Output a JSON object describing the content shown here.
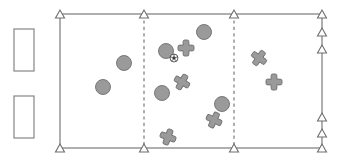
{
  "diagram": {
    "canvas": {
      "width": 344,
      "height": 162
    },
    "colors": {
      "line": "#6e6e6e",
      "marker_fill": "#9a9a9a",
      "marker_stroke": "#6e6e6e",
      "ball_fill": "#f2f2f2",
      "ball_stroke": "#3a3a3a",
      "rect_fill": "#ffffff",
      "rect_stroke": "#7a7a7a",
      "background": "#ffffff"
    },
    "field": {
      "name": "field-boundary",
      "left": 60,
      "right": 322,
      "top": 14,
      "bottom": 148
    },
    "divider_lines": [
      {
        "name": "dashed-divider-1",
        "x": 144,
        "style": "dashed"
      },
      {
        "name": "dashed-divider-2",
        "x": 234,
        "style": "dashed"
      }
    ],
    "side_rectangles": [
      {
        "name": "bench-box-top",
        "x": 14,
        "y": 29,
        "width": 20,
        "height": 42
      },
      {
        "name": "bench-box-bottom",
        "x": 14,
        "y": 96,
        "width": 20,
        "height": 42
      }
    ],
    "triangle_markers": {
      "top_edge": [
        {
          "x": 60,
          "y": 14
        },
        {
          "x": 144,
          "y": 14
        },
        {
          "x": 234,
          "y": 14
        },
        {
          "x": 322,
          "y": 14
        }
      ],
      "bottom_edge": [
        {
          "x": 60,
          "y": 148
        },
        {
          "x": 144,
          "y": 148
        },
        {
          "x": 234,
          "y": 148
        },
        {
          "x": 322,
          "y": 148
        }
      ],
      "right_edge": [
        {
          "x": 322,
          "y": 32
        },
        {
          "x": 322,
          "y": 49
        },
        {
          "x": 322,
          "y": 117
        },
        {
          "x": 322,
          "y": 133
        }
      ]
    },
    "circle_players": [
      {
        "name": "circle-player-1",
        "cx": 103,
        "cy": 87,
        "r": 7.5
      },
      {
        "name": "circle-player-2",
        "cx": 124,
        "cy": 63,
        "r": 7.5
      },
      {
        "name": "circle-player-3",
        "cx": 166,
        "cy": 51,
        "r": 7.5
      },
      {
        "name": "circle-player-4",
        "cx": 204,
        "cy": 32,
        "r": 7.5
      },
      {
        "name": "circle-player-5",
        "cx": 162,
        "cy": 93,
        "r": 7.5
      },
      {
        "name": "circle-player-6",
        "cx": 222,
        "cy": 104,
        "r": 7.5
      }
    ],
    "cross_players": [
      {
        "name": "cross-player-1",
        "cx": 186,
        "cy": 48,
        "size": 8,
        "rotation": 0
      },
      {
        "name": "cross-player-2",
        "cx": 182,
        "cy": 82,
        "size": 8,
        "rotation": 30
      },
      {
        "name": "cross-player-3",
        "cx": 214,
        "cy": 120,
        "size": 8,
        "rotation": 25
      },
      {
        "name": "cross-player-4",
        "cx": 168,
        "cy": 137,
        "size": 8,
        "rotation": 20
      },
      {
        "name": "cross-player-5",
        "cx": 259,
        "cy": 58,
        "size": 8,
        "rotation": 35
      },
      {
        "name": "cross-player-6",
        "cx": 274,
        "cy": 82,
        "size": 8,
        "rotation": 0
      }
    ],
    "ball": {
      "name": "ball",
      "cx": 174,
      "cy": 58,
      "r": 4
    }
  }
}
